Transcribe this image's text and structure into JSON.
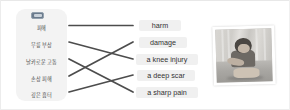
{
  "exercise": {
    "left_panel": {
      "badge_icon": "blue-tag-badge",
      "items": [
        {
          "id": "kr1",
          "label": "피해"
        },
        {
          "id": "kr2",
          "label": "무릎 부상"
        },
        {
          "id": "kr3",
          "label": "날카로운 고통"
        },
        {
          "id": "kr4",
          "label": "손상 피해"
        },
        {
          "id": "kr5",
          "label": "깊은 흉터"
        }
      ]
    },
    "right_panel": {
      "items": [
        {
          "id": "en1",
          "label": "harm"
        },
        {
          "id": "en2",
          "label": "damage"
        },
        {
          "id": "en3",
          "label": "a knee injury"
        },
        {
          "id": "en4",
          "label": "a deep scar"
        },
        {
          "id": "en5",
          "label": "a sharp pain"
        }
      ]
    },
    "connections": [
      {
        "from": "kr1",
        "to": "en1"
      },
      {
        "from": "kr2",
        "to": "en3"
      },
      {
        "from": "kr3",
        "to": "en5"
      },
      {
        "from": "kr4",
        "to": "en2"
      },
      {
        "from": "kr5",
        "to": "en4"
      }
    ],
    "image": {
      "name": "child-photo",
      "description": "grayscale photo of a child"
    },
    "colors": {
      "panel_background": "#f3f3f3",
      "label_background": "#f0f0f0",
      "line": "#4d4d4d",
      "badge": "#6a7a8c",
      "text": "#4a4a4a"
    }
  }
}
